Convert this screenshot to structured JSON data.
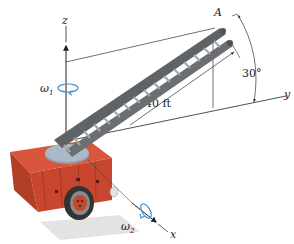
{
  "figure": {
    "type": "engineering-dynamics-diagram",
    "axes": {
      "x_label": "x",
      "y_label": "y",
      "z_label": "z"
    },
    "point_label": "A",
    "angular_velocities": {
      "omega1": {
        "symbol": "ω",
        "subscript": "1"
      },
      "omega2": {
        "symbol": "ω",
        "subscript": "2"
      }
    },
    "dimensions": {
      "ladder_length": "40 ft",
      "elevation_angle": "30°"
    },
    "colors": {
      "truck_body": "#c8462e",
      "truck_top": "#d9553b",
      "truck_side_dark": "#a93a26",
      "turntable": "#9fb0c0",
      "ladder": "#6b6e72",
      "ladder_light": "#9a9da1",
      "rotation_arrow": "#3a8fd0",
      "line": "#333333"
    }
  }
}
